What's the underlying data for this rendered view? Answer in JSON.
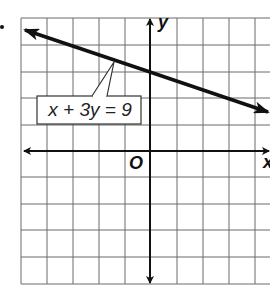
{
  "figure": {
    "type": "coordinate-plane",
    "grid": {
      "cols_left_of_y_axis": 5,
      "cols_right_of_y_axis": 4.5,
      "rows_above_x_axis": 5,
      "rows_below_x_axis": 5,
      "cell_px": 26.4
    },
    "axes": {
      "x_label": "x",
      "y_label": "y",
      "origin_label": "O"
    },
    "line": {
      "equation_label": "x + 3y = 9",
      "slope": -0.3333,
      "y_intercept": 3,
      "x_intercept": 9,
      "arrows": "both-ends"
    },
    "colors": {
      "grid": "#555555",
      "axes": "#111111",
      "line": "#111111",
      "background": "#ffffff"
    }
  }
}
